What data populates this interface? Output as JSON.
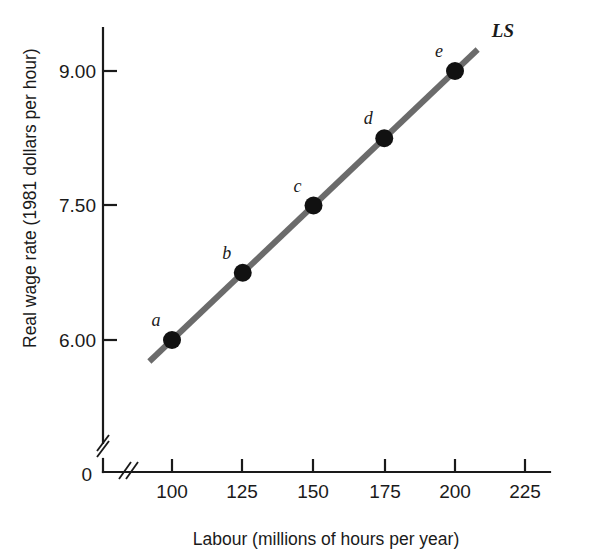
{
  "chart_data": {
    "type": "line",
    "title": "",
    "subtitle": "",
    "xlabel": "Labour (millions of hours per year)",
    "ylabel": "Real wage rate (1981 dollars per hour)",
    "xlim": [
      88,
      232
    ],
    "ylim": [
      5.6,
      9.5
    ],
    "grid": false,
    "legend_position": "inline-right-end",
    "origin_label": "0",
    "axis_break_x": true,
    "axis_break_y": true,
    "xticks": [
      {
        "value": 100,
        "label": "100"
      },
      {
        "value": 125,
        "label": "125"
      },
      {
        "value": 150,
        "label": "150"
      },
      {
        "value": 175,
        "label": "175"
      },
      {
        "value": 200,
        "label": "200"
      },
      {
        "value": 225,
        "label": "225"
      }
    ],
    "yticks": [
      {
        "value": 6.0,
        "label": "6.00"
      },
      {
        "value": 7.5,
        "label": "7.50"
      },
      {
        "value": 9.0,
        "label": "9.00"
      }
    ],
    "series": [
      {
        "name": "LS",
        "label": "LS",
        "color": "#6b6b6b",
        "line_width": 6,
        "marker_color": "#111111",
        "marker_radius": 9,
        "x": [
          100,
          125,
          150,
          175,
          200
        ],
        "values": [
          6.0,
          6.75,
          7.5,
          8.25,
          9.0
        ],
        "point_labels": [
          "a",
          "b",
          "c",
          "d",
          "e"
        ],
        "line_extent_x": [
          92,
          208
        ]
      }
    ],
    "annotations": [
      {
        "name": "series-label-ls",
        "text": "LS",
        "x": 213,
        "y": 9.38
      }
    ]
  }
}
